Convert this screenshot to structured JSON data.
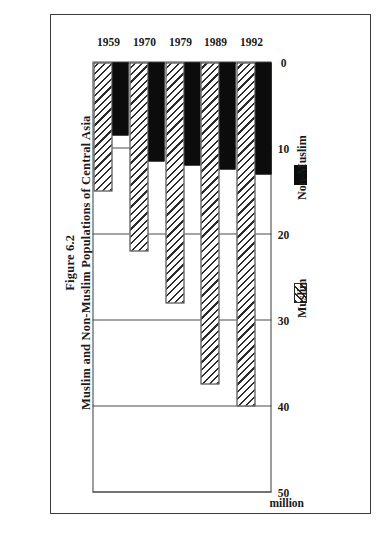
{
  "figure": {
    "number_label": "Figure 6.2",
    "title": "Muslim and Non-Muslim Populations of Central Asia"
  },
  "chart_data": {
    "type": "bar",
    "orientation": "horizontal",
    "title": "Muslim and Non-Muslim Populations of Central Asia",
    "subtitle": "Figure 6.2",
    "xlabel": "million",
    "ylabel": "",
    "unit": "million",
    "categories": [
      "1959",
      "1970",
      "1979",
      "1989",
      "1992"
    ],
    "tick_labels": [
      "50",
      "40",
      "30",
      "20",
      "10",
      "0"
    ],
    "ticks": [
      50,
      40,
      30,
      20,
      10,
      0
    ],
    "xlim": [
      0,
      50
    ],
    "axis_reversed": true,
    "grid": true,
    "legend_position": "right",
    "series": [
      {
        "name": "Muslim",
        "fill": "diagonal-hatch",
        "color": "#ffffff",
        "values": [
          15.0,
          22.0,
          28.0,
          37.5,
          40.0
        ]
      },
      {
        "name": "Non-Muslim",
        "fill": "solid",
        "color": "#0c0c0c",
        "values": [
          8.5,
          11.5,
          12.0,
          12.5,
          13.0
        ]
      }
    ]
  },
  "legend": {
    "entries": [
      {
        "label": "Non-Muslim",
        "swatch": "solid-black"
      },
      {
        "label": "Muslim",
        "swatch": "diagonal-hatch"
      }
    ]
  }
}
